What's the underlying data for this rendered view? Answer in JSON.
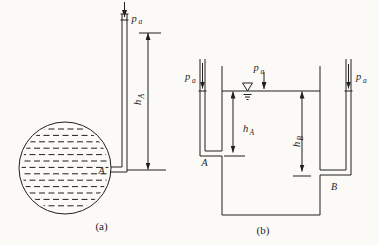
{
  "diagram": {
    "background": "#fbfaf7",
    "line_color": "#1f1f1f",
    "text_color": "#1f1f1f"
  },
  "labels": {
    "pressure_main": "p",
    "pressure_sub": "a",
    "height_main": "h",
    "height_sub_a": "A",
    "height_sub_b": "B",
    "point_a": "A",
    "point_b": "B",
    "caption_a": "(a)",
    "caption_b": "(b)"
  }
}
